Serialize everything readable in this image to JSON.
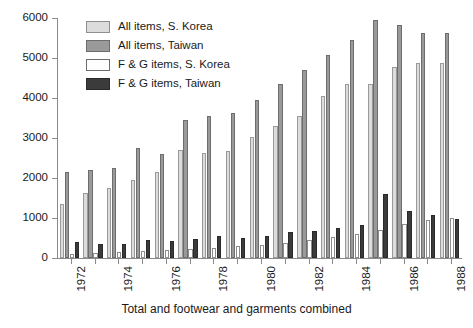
{
  "chart_data": {
    "type": "bar",
    "title": "",
    "subtitle": "",
    "xlabel": "Total and footwear and garments combined",
    "ylabel": "",
    "ylim": [
      0,
      6000
    ],
    "yticks": [
      0,
      1000,
      2000,
      3000,
      4000,
      5000,
      6000
    ],
    "ytick_labels": [
      "0",
      "1000",
      "2000",
      "3000",
      "4000",
      "5000",
      "6000"
    ],
    "grid": false,
    "legend_position": "top-left",
    "categories": [
      "1972",
      "1973",
      "1974",
      "1975",
      "1976",
      "1977",
      "1978",
      "1979",
      "1980",
      "1981",
      "1982",
      "1983",
      "1984",
      "1985",
      "1986",
      "1987",
      "1988"
    ],
    "xtick_labels": [
      "1972",
      "",
      "1974",
      "",
      "1976",
      "",
      "1978",
      "",
      "1980",
      "",
      "1982",
      "",
      "1984",
      "",
      "1986",
      "",
      "1988"
    ],
    "series": [
      {
        "name": "All items, S. Korea",
        "color": "#dcdcdc",
        "values": [
          1350,
          1630,
          1750,
          1950,
          2150,
          2700,
          2620,
          2680,
          3020,
          3300,
          3560,
          4060,
          4340,
          4340,
          4780,
          4880,
          4880
        ]
      },
      {
        "name": "All items, Taiwan",
        "color": "#9a9a9a",
        "values": [
          2150,
          2200,
          2250,
          2760,
          2600,
          3460,
          3550,
          3620,
          3960,
          4350,
          4700,
          5070,
          5460,
          5940,
          5830,
          5620,
          5620
        ]
      },
      {
        "name": "F & G items, S. Korea",
        "color": "#ffffff",
        "values": [
          110,
          130,
          150,
          180,
          200,
          230,
          260,
          290,
          330,
          380,
          440,
          520,
          600,
          700,
          840,
          940,
          1010
        ]
      },
      {
        "name": "F & G items, Taiwan",
        "color": "#3b3b3b",
        "values": [
          400,
          350,
          360,
          440,
          420,
          470,
          560,
          510,
          560,
          640,
          670,
          760,
          830,
          1610,
          1180,
          1080,
          980
        ]
      }
    ]
  },
  "legend": {
    "items": [
      {
        "label": "All items, S. Korea",
        "swatch": "s1"
      },
      {
        "label": "All items, Taiwan",
        "swatch": "s2"
      },
      {
        "label": "F & G items, S. Korea",
        "swatch": "s3"
      },
      {
        "label": "F & G items, Taiwan",
        "swatch": "s4"
      }
    ]
  }
}
